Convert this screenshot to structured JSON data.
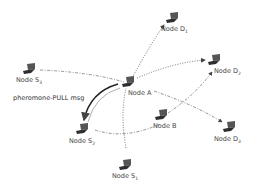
{
  "diagram": {
    "nodes": [
      {
        "id": "A",
        "name": "Node A",
        "sub": "",
        "x": 127,
        "y": 80
      },
      {
        "id": "B",
        "name": "Node B",
        "sub": "",
        "x": 160,
        "y": 118
      },
      {
        "id": "D1",
        "name": "Node D",
        "sub": "1",
        "x": 170,
        "y": 14
      },
      {
        "id": "D2",
        "name": "Node D",
        "sub": "2",
        "x": 214,
        "y": 58
      },
      {
        "id": "D3",
        "name": "Node D",
        "sub": "3",
        "x": 227,
        "y": 127
      },
      {
        "id": "S1",
        "name": "Node S",
        "sub": "1",
        "x": 123,
        "y": 150
      },
      {
        "id": "S2",
        "name": "Node S",
        "sub": "2",
        "x": 82,
        "y": 124
      },
      {
        "id": "S3",
        "name": "Node S",
        "sub": "3",
        "x": 28,
        "y": 68
      }
    ],
    "message_label": "pheromone-PULL msg",
    "colors": {
      "line": "#555555",
      "text": "#444444",
      "laptop": "#3a3a3a"
    }
  }
}
